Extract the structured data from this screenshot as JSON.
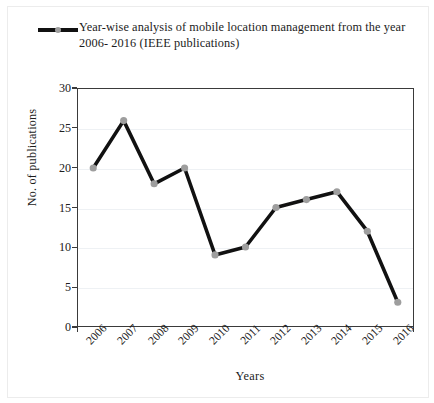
{
  "figure": {
    "legend_label": "Year-wise analysis of mobile location management from the year 2006- 2016 (IEEE publications)",
    "legend_marker_icon": "line-marker-icon",
    "line_color": "#111111",
    "marker_color": "#9e9e9e",
    "axis_color": "#3a3a3a",
    "grid_color": "#eef1f4"
  },
  "chart_data": {
    "type": "line",
    "title": "Year-wise analysis of mobile location management from the year 2006- 2016 (IEEE publications)",
    "xlabel": "Years",
    "ylabel": "No. of publications",
    "categories": [
      "2006",
      "2007",
      "2008",
      "2009",
      "2010",
      "2011",
      "2012",
      "2013",
      "2014",
      "2015",
      "2016"
    ],
    "values": [
      20,
      26,
      18,
      20,
      9,
      10,
      15,
      16,
      17,
      12,
      3
    ],
    "ylim": [
      0,
      30
    ],
    "yticks": [
      0,
      5,
      10,
      15,
      20,
      25,
      30
    ],
    "ytick_labels": [
      "0",
      "5",
      "10",
      "15",
      "20",
      "25",
      "30"
    ],
    "grid": true,
    "legend_position": "top-left",
    "series": [
      {
        "name": "Year-wise analysis of mobile location management from the year 2006- 2016 (IEEE publications)",
        "values": [
          20,
          26,
          18,
          20,
          9,
          10,
          15,
          16,
          17,
          12,
          3
        ]
      }
    ]
  }
}
